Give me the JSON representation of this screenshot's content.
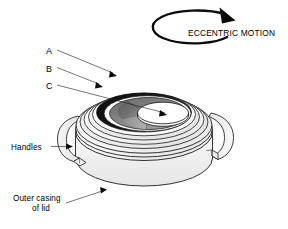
{
  "figure": {
    "background_color": "#ffffff",
    "ink_color": "#000000"
  },
  "motion_indicator": {
    "label": "ECCENTRIC MOTION",
    "icon": "circular-arrow-clockwise-icon",
    "direction": "clockwise",
    "arrowhead_position": "top-right"
  },
  "callouts": [
    {
      "key": "A",
      "label": "A",
      "target": "black-crescent-band"
    },
    {
      "key": "B",
      "label": "B",
      "target": "middle-ring"
    },
    {
      "key": "C",
      "label": "C",
      "target": "eccentric-inner-disc"
    }
  ],
  "annotations": [
    {
      "key": "handles",
      "label": "Handles",
      "lines": [
        "Handles"
      ],
      "target": "left-handle"
    },
    {
      "key": "outer_casing",
      "label": "Outer casing of lid",
      "lines": [
        "Outer casing",
        "of lid"
      ],
      "target": "outer-casing-wall"
    }
  ],
  "parts": [
    {
      "name": "outer-casing-wall",
      "fill": "#f1f1f1"
    },
    {
      "name": "lid-top-rim",
      "fill": "#fafafa"
    },
    {
      "name": "ring-outer",
      "fill": "#f6f6f6"
    },
    {
      "name": "ring-middle",
      "fill": "#ededed"
    },
    {
      "name": "black-crescent-band",
      "fill": "#111111"
    },
    {
      "name": "recess-floor",
      "fill": "#8e8e8e"
    },
    {
      "name": "recess-floor-dark",
      "fill": "#5e5e5e"
    },
    {
      "name": "eccentric-inner-disc",
      "fill": "#ffffff"
    },
    {
      "name": "left-handle",
      "fill": "#ececec"
    },
    {
      "name": "right-handle",
      "fill": "#efefef"
    }
  ],
  "colors": {
    "ink": "#000000",
    "line": "#1d1d1d",
    "light_gray": "#f1f1f1",
    "mid_gray": "#8e8e8e",
    "dark_gray": "#5e5e5e",
    "black_band": "#111111",
    "white": "#ffffff"
  }
}
